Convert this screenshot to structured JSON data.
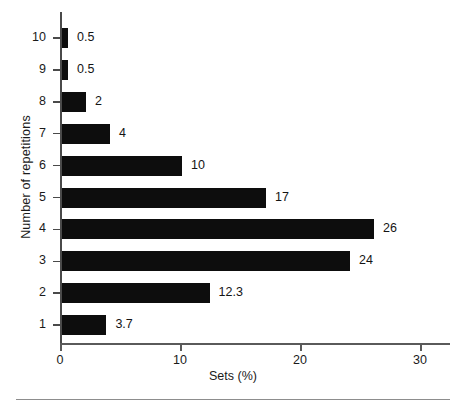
{
  "chart_data": {
    "type": "bar",
    "orientation": "horizontal",
    "title": "",
    "xlabel": "Sets (%)",
    "ylabel": "Number of repetitions",
    "categories": [
      "1",
      "2",
      "3",
      "4",
      "5",
      "6",
      "7",
      "8",
      "9",
      "10"
    ],
    "values": [
      3.7,
      12.3,
      24,
      26,
      17,
      10,
      4,
      2,
      0.5,
      0.5
    ],
    "value_labels": [
      "3.7",
      "12.3",
      "24",
      "26",
      "17",
      "10",
      "4",
      "2",
      "0.5",
      "0.5"
    ],
    "xlim": [
      0,
      32.5
    ],
    "ylim": [
      0.4,
      10.6
    ],
    "x_ticks": [
      0,
      10,
      20,
      30
    ],
    "x_tick_labels": [
      "0",
      "10",
      "20",
      "30"
    ],
    "y_ticks": [
      "1",
      "2",
      "3",
      "4",
      "5",
      "6",
      "7",
      "8",
      "9",
      "10"
    ],
    "grid": false,
    "legend": false,
    "bar_color": "#0d0d0d",
    "axis_color": "#4a4a4a",
    "background": "#ffffff"
  },
  "figure": {
    "y_axis_title": "Number of repetitions",
    "x_axis_title": "Sets (%)"
  }
}
